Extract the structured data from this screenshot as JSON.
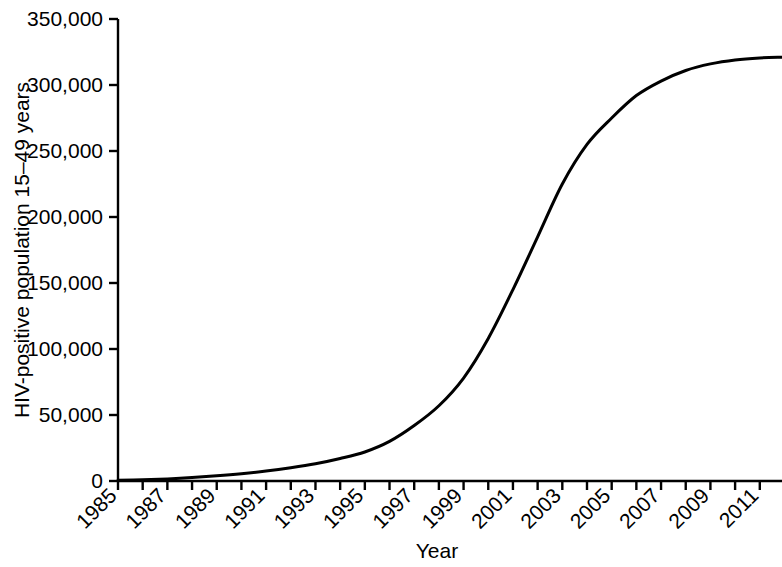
{
  "chart_data": {
    "type": "line",
    "title": "",
    "xlabel": "Year",
    "ylabel": "HIV-positive  population 15–49 years",
    "xlim": [
      1985,
      2011.9
    ],
    "ylim": [
      0,
      350000
    ],
    "grid": false,
    "legend": null,
    "line_color": "#000000",
    "background_color": "#ffffff",
    "axis_color": "#000000",
    "y_ticks": [
      0,
      50000,
      100000,
      150000,
      200000,
      250000,
      300000,
      350000
    ],
    "y_tick_labels": [
      "0",
      "50,000",
      "100,000",
      "150,000",
      "200,000",
      "250,000",
      "300,000",
      "350,000"
    ],
    "x_ticks": [
      1985,
      1986,
      1987,
      1988,
      1989,
      1990,
      1991,
      1992,
      1993,
      1994,
      1995,
      1996,
      1997,
      1998,
      1999,
      2000,
      2001,
      2002,
      2003,
      2004,
      2005,
      2006,
      2007,
      2008,
      2009,
      2010,
      2011
    ],
    "x_tick_labels_major": [
      "1985",
      "1987",
      "1989",
      "1991",
      "1993",
      "1995",
      "1997",
      "1999",
      "2001",
      "2003",
      "2005",
      "2007",
      "2009",
      "2011"
    ],
    "x_major_years": [
      1985,
      1987,
      1989,
      1991,
      1993,
      1995,
      1997,
      1999,
      2001,
      2003,
      2005,
      2007,
      2009,
      2011
    ],
    "series": [
      {
        "name": "HIV-positive population 15-49 years",
        "x": [
          1985,
          1986,
          1987,
          1988,
          1989,
          1990,
          1991,
          1992,
          1993,
          1994,
          1995,
          1996,
          1997,
          1998,
          1999,
          2000,
          2001,
          2002,
          2003,
          2004,
          2005,
          2006,
          2007,
          2008,
          2009,
          2010,
          2011,
          2011.9
        ],
        "values": [
          500,
          900,
          1600,
          2600,
          3900,
          5500,
          7500,
          10000,
          13000,
          17000,
          22000,
          30000,
          42000,
          57000,
          78000,
          108000,
          145000,
          185000,
          225000,
          255000,
          275000,
          292000,
          303000,
          311000,
          316000,
          319000,
          320500,
          321000
        ]
      }
    ]
  }
}
